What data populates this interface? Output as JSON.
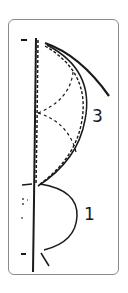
{
  "diagram": {
    "labels": {
      "top_shape": "3",
      "bottom_shape": "1"
    },
    "colors": {
      "stroke": "#1a1a1a",
      "border": "#8a8a8a",
      "background": "#ffffff"
    }
  }
}
